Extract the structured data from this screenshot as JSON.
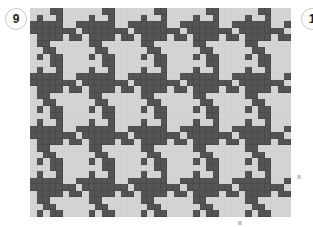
{
  "figure": {
    "number_label": "9",
    "next_number_label": "1",
    "colors": {
      "dark": "#545454",
      "light": "#d4d4d4",
      "grid_line": "#d0d0d0"
    },
    "grid": {
      "cols": 40,
      "rows": 32,
      "repeat_width": 8,
      "repeat_height": 8,
      "motif": [
        [
          0,
          0,
          0,
          1,
          1,
          0,
          0,
          0
        ],
        [
          0,
          1,
          0,
          0,
          1,
          0,
          0,
          0
        ],
        [
          1,
          1,
          1,
          1,
          1,
          0,
          0,
          1
        ],
        [
          1,
          1,
          1,
          1,
          1,
          1,
          1,
          0
        ],
        [
          0,
          1,
          1,
          1,
          1,
          0,
          1,
          1
        ],
        [
          0,
          1,
          1,
          0,
          0,
          0,
          0,
          0
        ],
        [
          0,
          0,
          1,
          1,
          0,
          0,
          0,
          0
        ],
        [
          0,
          1,
          0,
          1,
          1,
          0,
          0,
          0
        ]
      ]
    },
    "tick_labels": [
      "",
      ""
    ]
  }
}
